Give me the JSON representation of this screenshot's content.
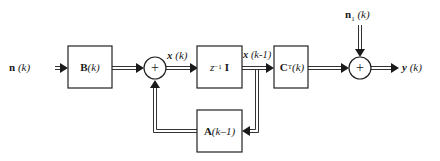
{
  "diagram": {
    "type": "block-diagram",
    "input_label": "n (k)",
    "blocks": [
      {
        "id": "B",
        "label": "B (k)"
      },
      {
        "id": "delay",
        "label": "z⁻¹ I"
      },
      {
        "id": "C",
        "label": "Cᵀ (k)"
      },
      {
        "id": "A",
        "label": "A (k–1)"
      }
    ],
    "summers": [
      {
        "id": "sum1",
        "symbol": "+"
      },
      {
        "id": "sum2",
        "symbol": "+"
      }
    ],
    "signals": {
      "state": "x (k)",
      "delayed_state": "x (k-1)",
      "noise": "n₁ (k)",
      "output": "y (k)"
    },
    "edges": [
      {
        "from": "input",
        "to": "B",
        "label": "n (k)"
      },
      {
        "from": "B",
        "to": "sum1"
      },
      {
        "from": "sum1",
        "to": "delay",
        "label": "x (k)"
      },
      {
        "from": "delay",
        "to": "C",
        "label": "x (k-1)"
      },
      {
        "from": "delay",
        "to": "A",
        "label": "x (k-1)"
      },
      {
        "from": "A",
        "to": "sum1"
      },
      {
        "from": "C",
        "to": "sum2"
      },
      {
        "from": "noise",
        "to": "sum2",
        "label": "n₁ (k)"
      },
      {
        "from": "sum2",
        "to": "output",
        "label": "y (k)"
      }
    ]
  },
  "labels": {
    "n_bold": "n",
    "n_arg": " (k)",
    "B_bold": "B",
    "B_arg": " (k)",
    "x_bold": "x",
    "x_arg": " (k)",
    "xk1_arg": " (k-1)",
    "z": "z",
    "z_exp": "−1",
    "I": "I",
    "C_bold": "C",
    "C_exp": "T",
    "C_arg": " (k)",
    "A_bold": "A",
    "A_arg": " (k–1)",
    "n1_bold": "n",
    "n1_sub": "1",
    "n1_arg": " (k)",
    "y_bold": "y",
    "y_arg": " (k)",
    "plus": "+"
  }
}
